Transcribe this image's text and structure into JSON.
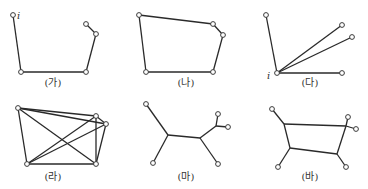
{
  "figures": [
    {
      "id": "ga",
      "caption": "(가)",
      "description": "open path",
      "vertex_label": "i",
      "nodes": 5,
      "edges": [
        [
          0,
          1
        ],
        [
          1,
          2
        ],
        [
          2,
          3
        ],
        [
          3,
          4
        ]
      ]
    },
    {
      "id": "na",
      "caption": "(나)",
      "description": "closed cycle",
      "nodes": 5,
      "edges": [
        [
          0,
          1
        ],
        [
          1,
          2
        ],
        [
          2,
          3
        ],
        [
          3,
          4
        ],
        [
          4,
          0
        ]
      ]
    },
    {
      "id": "da",
      "caption": "(다)",
      "description": "star from vertex i",
      "vertex_label": "i",
      "nodes": 5,
      "edges": [
        [
          1,
          0
        ],
        [
          1,
          2
        ],
        [
          1,
          3
        ],
        [
          1,
          4
        ]
      ]
    },
    {
      "id": "ra",
      "caption": "(라)",
      "description": "complete graph K5",
      "nodes": 5,
      "edges": [
        [
          0,
          1
        ],
        [
          0,
          2
        ],
        [
          0,
          3
        ],
        [
          0,
          4
        ],
        [
          1,
          2
        ],
        [
          1,
          3
        ],
        [
          1,
          4
        ],
        [
          2,
          3
        ],
        [
          2,
          4
        ],
        [
          3,
          4
        ]
      ]
    },
    {
      "id": "ma",
      "caption": "(마)",
      "description": "tree with Steiner points",
      "nodes": 5,
      "steiner_points": 3
    },
    {
      "id": "ba",
      "caption": "(바)",
      "description": "network with Steiner cycle",
      "nodes": 5,
      "steiner_points": 4
    }
  ]
}
